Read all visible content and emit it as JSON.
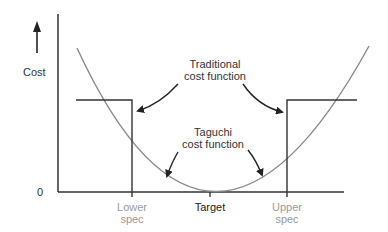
{
  "diagram": {
    "y_axis_label": "Cost",
    "origin_label": "0",
    "x_labels": {
      "lower_spec": [
        "Lower",
        "spec"
      ],
      "target": "Target",
      "upper_spec": [
        "Upper",
        "spec"
      ]
    },
    "annotations": {
      "traditional": [
        "Traditional",
        "cost function"
      ],
      "taguchi": [
        "Taguchi",
        "cost function"
      ]
    },
    "colors": {
      "axis": "#222222",
      "curve": "#8a8a8a",
      "spec_label": "#9a9a9a",
      "text": "#222222"
    }
  }
}
